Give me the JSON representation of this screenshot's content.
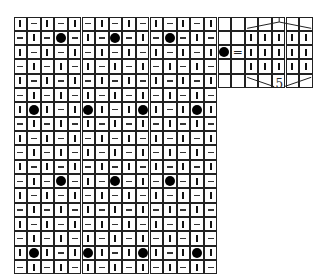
{
  "chart": {
    "type": "knitting-chart",
    "columns": 15,
    "rows": 18,
    "symbols": {
      "k": "knit-stitch (vertical bar)",
      "p": "purl-stitch (horizontal dash)",
      "o": "bobble (filled circle)"
    },
    "grid": [
      "kpkpkpkpkpkpkpk",
      "pkpopkpopkpopkp",
      "kpkpkpkpkpkpkpk",
      "pkpkpkpkpkpkpkp",
      "kpkpkpkpkpkpkpk",
      "pkpkpkpkpkpkpkp",
      "kokpkokpkokpkok",
      "pkpkpkpkpkpkpkp",
      "kpkpkpkpkpkpkpk",
      "pkpkpkpkpkpkpkp",
      "kpkpkpkpkpkpkpk",
      "pkpopkpopkpopkp",
      "kpkpkpkpkpkpkpk",
      "pkpkpkpkpkpkpkp",
      "kpkpkpkpkpkpkpk",
      "pkpkpkpkpkpkpkp",
      "kokpkokpkokpkok",
      "pkpkpkpkpkpkpkp"
    ]
  },
  "legend": {
    "symbol": "bobble",
    "equals": "=",
    "expansion_columns": 5,
    "expansion_rows": 3,
    "stitch_count_label": "5"
  }
}
